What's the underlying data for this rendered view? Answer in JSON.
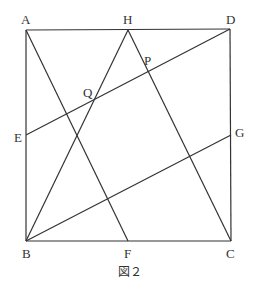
{
  "figure": {
    "caption": "図２",
    "points": {
      "A": {
        "label": "A",
        "x": 26,
        "y": 30
      },
      "H": {
        "label": "H",
        "x": 128,
        "y": 30
      },
      "D": {
        "label": "D",
        "x": 230,
        "y": 29
      },
      "E": {
        "label": "E",
        "x": 26,
        "y": 135
      },
      "G": {
        "label": "G",
        "x": 231,
        "y": 135
      },
      "B": {
        "label": "B",
        "x": 26,
        "y": 241
      },
      "F": {
        "label": "F",
        "x": 128,
        "y": 241
      },
      "C": {
        "label": "C",
        "x": 231,
        "y": 241
      },
      "P": {
        "label": "P",
        "x": 148,
        "y": 71
      },
      "Q": {
        "label": "Q",
        "x": 95,
        "y": 98
      }
    },
    "segments": [
      "AD",
      "DC",
      "CB",
      "BA",
      "AF",
      "BH",
      "HC",
      "ED",
      "BG"
    ]
  }
}
